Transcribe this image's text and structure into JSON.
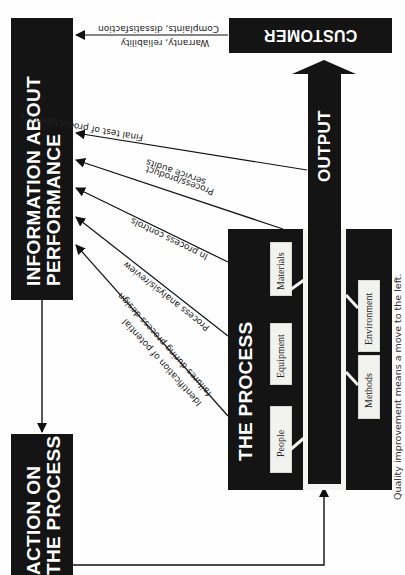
{
  "diagram": {
    "orientation": "rotated -90 degrees",
    "nodes": {
      "customer": "CUSTOMER",
      "information": [
        "INFORMATION ABOUT",
        "PERFORMANCE"
      ],
      "action": [
        "ACTION ON",
        "THE PROCESS"
      ],
      "process": "THE PROCESS",
      "output": "OUTPUT"
    },
    "process_factors": {
      "top": [
        "People",
        "Equipment",
        "Materials"
      ],
      "bottom": [
        "Methods",
        "Environment"
      ]
    },
    "feedback_labels": {
      "customer_top": "Complaints, dissatisfaction",
      "customer_bottom": "Warranty, reliability",
      "final_test": "Final test of product/service",
      "audits_line1": "Process/product",
      "audits_line2": "service audits",
      "in_process": "In process controls",
      "analysis": "Process analysis/review",
      "identification_line1": "Identification of potential",
      "identification_line2": "failures during process design"
    },
    "caption": "Quality improvement means a move to the left.",
    "colors": {
      "block": "#141414",
      "background": "#fefefe",
      "factor_box": "#f2f2ee"
    }
  }
}
